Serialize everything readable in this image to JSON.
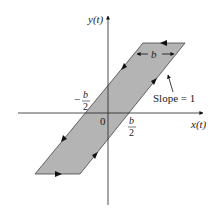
{
  "diagram": {
    "type": "hysteresis-loop",
    "axes": {
      "x_label": "x(t)",
      "y_label": "y(t)",
      "origin_label": "0"
    },
    "annotations": {
      "width_label": "b",
      "neg_half_num": "b",
      "neg_half_den": "2",
      "neg_sign": "−",
      "pos_half_num": "b",
      "pos_half_den": "2",
      "slope_label": "Slope = 1"
    },
    "colors": {
      "fill": "#b4b4b4",
      "stroke": "#333333"
    }
  }
}
